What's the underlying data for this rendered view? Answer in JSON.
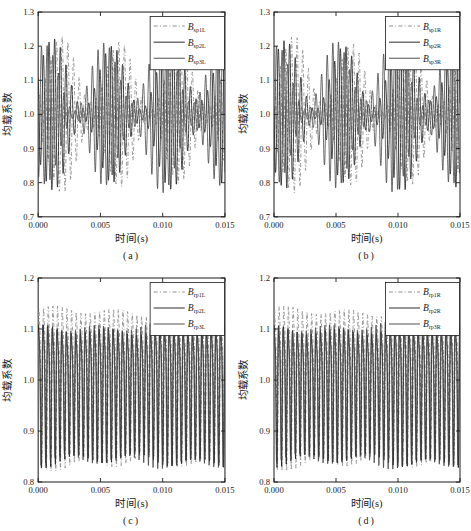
{
  "figure": {
    "background": "#ffffff",
    "ink_color": "#1a1a1a",
    "dashdot_color": "#8f8f8f",
    "solid_color_2": "#141414",
    "solid_color_3": "#3d3d3d"
  },
  "chart_data": [
    {
      "type": "line",
      "subplot_label": "(a)",
      "xlabel": "时间(s)",
      "ylabel": "均载系数",
      "xlim": [
        0,
        0.015
      ],
      "ylim": [
        0.7,
        1.3
      ],
      "xtick_labels": [
        "0.000",
        "0.005",
        "0.010",
        "0.015"
      ],
      "ytick_labels": [
        "0.7",
        "0.8",
        "0.9",
        "1.0",
        "1.1",
        "1.2",
        "1.3"
      ],
      "grid": false,
      "legend_position": "upper-right",
      "series": [
        {
          "name": "B_sp1L",
          "label_main": "B",
          "label_sub": "sp1L",
          "line_style": "dashdot",
          "color": "#8f8f8f",
          "approx_range": [
            0.78,
            1.23
          ],
          "signal": {
            "mean": 1.0,
            "carrier_hz": 2200,
            "carrier_phase": 0.0,
            "env_base": 0.12,
            "env_amp": 0.095,
            "env_hz": 213,
            "env_phase": -1.0,
            "env2_amp": 0.015,
            "env2_hz": 67,
            "env2_phase": 0.5,
            "harm2": 0
          }
        },
        {
          "name": "B_sp2L",
          "label_main": "B",
          "label_sub": "sp2L",
          "line_style": "solid",
          "color": "#141414",
          "approx_range": [
            0.78,
            1.22
          ],
          "signal": {
            "mean": 1.0,
            "carrier_hz": 2200,
            "carrier_phase": 2.094,
            "env_base": 0.12,
            "env_amp": 0.095,
            "env_hz": 213,
            "env_phase": -0.1,
            "env2_amp": 0.015,
            "env2_hz": 67,
            "env2_phase": 2.1,
            "harm2": 0
          }
        },
        {
          "name": "B_sp3L",
          "label_main": "B",
          "label_sub": "sp3L",
          "line_style": "solid",
          "color": "#3d3d3d",
          "approx_range": [
            0.78,
            1.21
          ],
          "signal": {
            "mean": 1.0,
            "carrier_hz": 2200,
            "carrier_phase": 4.189,
            "env_base": 0.12,
            "env_amp": 0.095,
            "env_hz": 213,
            "env_phase": 0.8,
            "env2_amp": 0.015,
            "env2_hz": 67,
            "env2_phase": 3.7,
            "harm2": 0
          }
        }
      ]
    },
    {
      "type": "line",
      "subplot_label": "(b)",
      "xlabel": "时间(s)",
      "ylabel": "均载系数",
      "xlim": [
        0,
        0.015
      ],
      "ylim": [
        0.7,
        1.3
      ],
      "xtick_labels": [
        "0.000",
        "0.005",
        "0.010",
        "0.015"
      ],
      "ytick_labels": [
        "0.7",
        "0.8",
        "0.9",
        "1.0",
        "1.1",
        "1.2",
        "1.3"
      ],
      "grid": false,
      "legend_position": "upper-right",
      "series": [
        {
          "name": "B_sp1R",
          "label_main": "B",
          "label_sub": "sp1R",
          "line_style": "dashdot",
          "color": "#8f8f8f",
          "approx_range": [
            0.77,
            1.22
          ],
          "signal": {
            "mean": 1.0,
            "carrier_hz": 2200,
            "carrier_phase": 0.9,
            "env_base": 0.12,
            "env_amp": 0.095,
            "env_hz": 213,
            "env_phase": -0.6,
            "env2_amp": 0.015,
            "env2_hz": 67,
            "env2_phase": 1.0,
            "harm2": 0
          }
        },
        {
          "name": "B_sp2R",
          "label_main": "B",
          "label_sub": "sp2R",
          "line_style": "solid",
          "color": "#141414",
          "approx_range": [
            0.76,
            1.21
          ],
          "signal": {
            "mean": 1.0,
            "carrier_hz": 2200,
            "carrier_phase": 2.994,
            "env_base": 0.12,
            "env_amp": 0.095,
            "env_hz": 213,
            "env_phase": 0.3,
            "env2_amp": 0.015,
            "env2_hz": 67,
            "env2_phase": 2.6,
            "harm2": 0
          }
        },
        {
          "name": "B_sp3R",
          "label_main": "B",
          "label_sub": "sp3R",
          "line_style": "solid",
          "color": "#3d3d3d",
          "approx_range": [
            0.77,
            1.21
          ],
          "signal": {
            "mean": 1.0,
            "carrier_hz": 2200,
            "carrier_phase": 5.089,
            "env_base": 0.12,
            "env_amp": 0.095,
            "env_hz": 213,
            "env_phase": 1.2,
            "env2_amp": 0.015,
            "env2_hz": 67,
            "env2_phase": 4.2,
            "harm2": 0
          }
        }
      ]
    },
    {
      "type": "line",
      "subplot_label": "(c)",
      "xlabel": "时间(s)",
      "ylabel": "均载系数",
      "xlim": [
        0,
        0.015
      ],
      "ylim": [
        0.8,
        1.2
      ],
      "xtick_labels": [
        "0.000",
        "0.005",
        "0.010",
        "0.015"
      ],
      "ytick_labels": [
        "0.8",
        "0.9",
        "1.0",
        "1.1",
        "1.2"
      ],
      "grid": false,
      "legend_position": "upper-right",
      "series": [
        {
          "name": "B_rp1L",
          "label_main": "B",
          "label_sub": "rp1L",
          "line_style": "dashdot",
          "color": "#8f8f8f",
          "approx_range": [
            0.84,
            1.15
          ],
          "signal": {
            "mean": 1.015,
            "carrier_hz": 2667,
            "carrier_phase": 0.0,
            "env_base": 0.18,
            "env_amp": 0.01,
            "env_hz": 200,
            "env_phase": 0.0,
            "env2_amp": 0.006,
            "env2_hz": 67,
            "env2_phase": 1.0,
            "harm2": 0.22
          }
        },
        {
          "name": "B_rp2L",
          "label_main": "B",
          "label_sub": "rp2L",
          "line_style": "solid",
          "color": "#141414",
          "approx_range": [
            0.84,
            1.1
          ],
          "signal": {
            "mean": 0.995,
            "carrier_hz": 2667,
            "carrier_phase": 0.5,
            "env_base": 0.155,
            "env_amp": 0.01,
            "env_hz": 200,
            "env_phase": 1.0,
            "env2_amp": 0.006,
            "env2_hz": 67,
            "env2_phase": 2.0,
            "harm2": 0.22
          }
        },
        {
          "name": "B_rp3L",
          "label_main": "B",
          "label_sub": "rp3L",
          "line_style": "solid",
          "color": "#3d3d3d",
          "approx_range": [
            0.84,
            1.11
          ],
          "signal": {
            "mean": 0.998,
            "carrier_hz": 2667,
            "carrier_phase": 1.0,
            "env_base": 0.16,
            "env_amp": 0.01,
            "env_hz": 200,
            "env_phase": 2.0,
            "env2_amp": 0.006,
            "env2_hz": 67,
            "env2_phase": 3.0,
            "harm2": 0.22
          }
        }
      ]
    },
    {
      "type": "line",
      "subplot_label": "(d)",
      "xlabel": "时间(s)",
      "ylabel": "均载系数",
      "xlim": [
        0,
        0.015
      ],
      "ylim": [
        0.8,
        1.2
      ],
      "xtick_labels": [
        "0.000",
        "0.005",
        "0.010",
        "0.015"
      ],
      "ytick_labels": [
        "0.8",
        "0.9",
        "1.0",
        "1.1",
        "1.2"
      ],
      "grid": false,
      "legend_position": "upper-right",
      "series": [
        {
          "name": "B_rp1R",
          "label_main": "B",
          "label_sub": "rp1R",
          "line_style": "dashdot",
          "color": "#8f8f8f",
          "approx_range": [
            0.84,
            1.15
          ],
          "signal": {
            "mean": 1.015,
            "carrier_hz": 2667,
            "carrier_phase": 0.35,
            "env_base": 0.18,
            "env_amp": 0.01,
            "env_hz": 200,
            "env_phase": 0.4,
            "env2_amp": 0.006,
            "env2_hz": 67,
            "env2_phase": 1.4,
            "harm2": 0.22
          }
        },
        {
          "name": "B_rp2R",
          "label_main": "B",
          "label_sub": "rp2R",
          "line_style": "solid",
          "color": "#141414",
          "approx_range": [
            0.83,
            1.1
          ],
          "signal": {
            "mean": 0.995,
            "carrier_hz": 2667,
            "carrier_phase": 0.85,
            "env_base": 0.155,
            "env_amp": 0.01,
            "env_hz": 200,
            "env_phase": 1.4,
            "env2_amp": 0.006,
            "env2_hz": 67,
            "env2_phase": 2.4,
            "harm2": 0.22
          }
        },
        {
          "name": "B_rp3R",
          "label_main": "B",
          "label_sub": "rp3R",
          "line_style": "solid",
          "color": "#3d3d3d",
          "approx_range": [
            0.84,
            1.11
          ],
          "signal": {
            "mean": 0.998,
            "carrier_hz": 2667,
            "carrier_phase": 1.35,
            "env_base": 0.16,
            "env_amp": 0.01,
            "env_hz": 200,
            "env_phase": 2.4,
            "env2_amp": 0.006,
            "env2_hz": 67,
            "env2_phase": 3.4,
            "harm2": 0.22
          }
        }
      ]
    }
  ]
}
